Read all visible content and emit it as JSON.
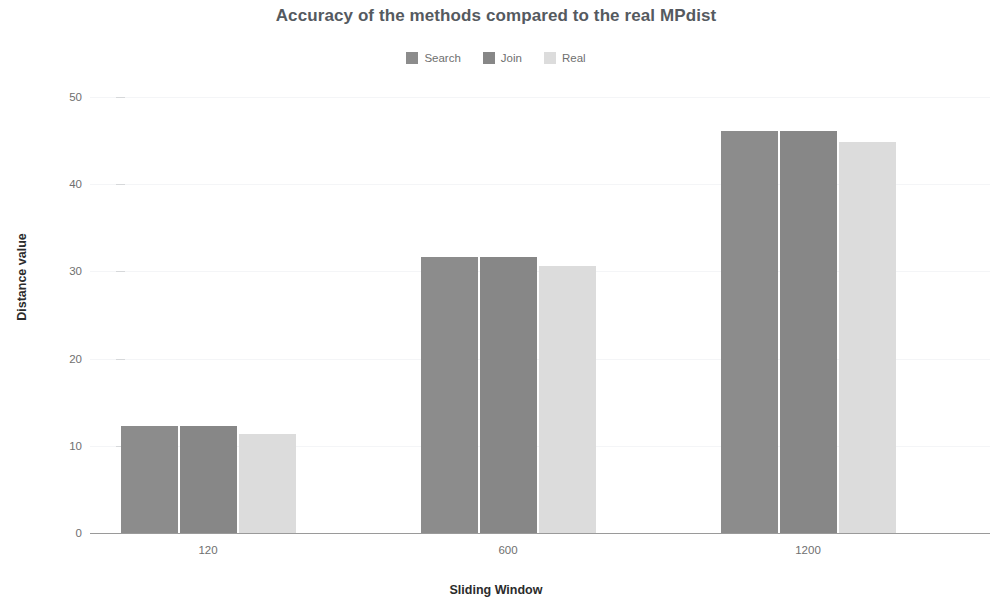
{
  "chart_data": {
    "type": "bar",
    "title": "Accuracy of the methods compared to the real MPdist",
    "xlabel": "Sliding Window",
    "ylabel": "Distance value",
    "categories": [
      "120",
      "600",
      "1200"
    ],
    "series": [
      {
        "name": "Search",
        "color": "#8c8c8c",
        "values": [
          12.3,
          31.7,
          46.1
        ]
      },
      {
        "name": "Join",
        "color": "#878787",
        "values": [
          12.3,
          31.7,
          46.1
        ]
      },
      {
        "name": "Real",
        "color": "#dcdcdc",
        "values": [
          11.4,
          30.6,
          44.8
        ]
      }
    ],
    "ylim": [
      0,
      50
    ],
    "yticks": [
      "0",
      "10",
      "20",
      "30",
      "40",
      "50"
    ],
    "ytick_values": [
      0,
      10,
      20,
      30,
      40,
      50
    ],
    "grid": true,
    "legend_position": "top-center",
    "background_color": "#ffffff",
    "gridline_color": "#f4f5f7",
    "axis_color": "#9a9a9a",
    "tick_text_color": "#6f6f6f",
    "title_color": "#555a5f"
  }
}
